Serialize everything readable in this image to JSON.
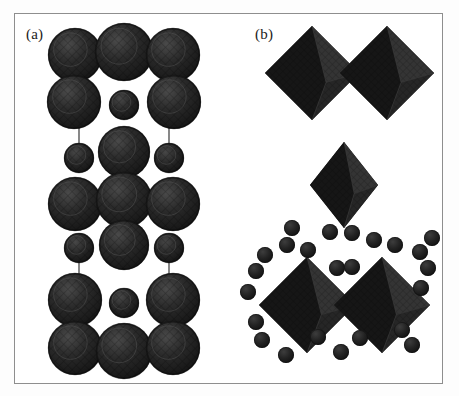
{
  "figure": {
    "type": "crystal-structure-illustration",
    "background_color": "#ffffff",
    "frame": {
      "color": "#8e8e8e",
      "x": 14,
      "y": 13,
      "width": 429,
      "height": 371
    },
    "panels": [
      {
        "id": "a",
        "label": "(a)",
        "label_x": 26,
        "label_y": 26,
        "representation": "space-filling-sphere-packing",
        "description": "Vertical stack of alternating layers of large and small spheres forming a unit cell column",
        "sphere_color": "#242424",
        "sphere_highlight_color": "#3a3a3a",
        "sphere_shadow_color": "#141414",
        "bond_color": "#555555",
        "column_center_x": 124,
        "large_radius": 27,
        "medium_radius": 24,
        "small_radius": 14
      },
      {
        "id": "b",
        "label": "(b)",
        "label_x": 255,
        "label_y": 26,
        "representation": "polyhedral-octahedra-and-spheres",
        "description": "Corner-sharing octahedra pairs with surrounding small spheres",
        "octahedron_front_color": "#1f1f1f",
        "octahedron_light_face_color": "#343434",
        "octahedron_dark_face_color": "#161616",
        "sphere_color": "#242424",
        "groups": [
          "top-octahedra-pair",
          "middle-single-octahedron",
          "bottom-octahedra-pair",
          "scattered-spheres"
        ]
      }
    ]
  },
  "chart_data": {
    "type": "scatter",
    "title": "",
    "xlabel": "",
    "ylabel": "",
    "grid": false,
    "legend": null,
    "panel_a_spheres": [
      {
        "cx": 75,
        "cy": 55,
        "r": 27,
        "kind": "large"
      },
      {
        "cx": 124,
        "cy": 52,
        "r": 29,
        "kind": "large"
      },
      {
        "cx": 173,
        "cy": 55,
        "r": 27,
        "kind": "large"
      },
      {
        "cx": 74,
        "cy": 102,
        "r": 27,
        "kind": "large"
      },
      {
        "cx": 124,
        "cy": 105,
        "r": 15,
        "kind": "small"
      },
      {
        "cx": 174,
        "cy": 102,
        "r": 27,
        "kind": "large"
      },
      {
        "cx": 79,
        "cy": 158,
        "r": 15,
        "kind": "small"
      },
      {
        "cx": 124,
        "cy": 152,
        "r": 26,
        "kind": "large"
      },
      {
        "cx": 169,
        "cy": 158,
        "r": 15,
        "kind": "small"
      },
      {
        "cx": 75,
        "cy": 204,
        "r": 27,
        "kind": "large"
      },
      {
        "cx": 124,
        "cy": 200,
        "r": 28,
        "kind": "large"
      },
      {
        "cx": 173,
        "cy": 204,
        "r": 27,
        "kind": "large"
      },
      {
        "cx": 79,
        "cy": 248,
        "r": 15,
        "kind": "small"
      },
      {
        "cx": 124,
        "cy": 245,
        "r": 25,
        "kind": "large"
      },
      {
        "cx": 169,
        "cy": 248,
        "r": 15,
        "kind": "small"
      },
      {
        "cx": 75,
        "cy": 300,
        "r": 27,
        "kind": "large"
      },
      {
        "cx": 124,
        "cy": 303,
        "r": 15,
        "kind": "small"
      },
      {
        "cx": 173,
        "cy": 300,
        "r": 27,
        "kind": "large"
      },
      {
        "cx": 75,
        "cy": 348,
        "r": 27,
        "kind": "large"
      },
      {
        "cx": 124,
        "cy": 351,
        "r": 28,
        "kind": "large"
      },
      {
        "cx": 173,
        "cy": 348,
        "r": 27,
        "kind": "large"
      }
    ],
    "panel_a_bonds": [
      {
        "x1": 79,
        "y1": 128,
        "x2": 79,
        "y2": 145
      },
      {
        "x1": 169,
        "y1": 128,
        "x2": 169,
        "y2": 145
      },
      {
        "x1": 79,
        "y1": 262,
        "x2": 79,
        "y2": 278
      },
      {
        "x1": 169,
        "y1": 262,
        "x2": 169,
        "y2": 278
      }
    ],
    "panel_b_octahedra": [
      {
        "cx": 312,
        "cy": 73,
        "rx": 47,
        "ry": 47,
        "group": "top-pair-left"
      },
      {
        "cx": 387,
        "cy": 73,
        "rx": 47,
        "ry": 47,
        "group": "top-pair-right"
      },
      {
        "cx": 344,
        "cy": 185,
        "rx": 34,
        "ry": 43,
        "group": "middle-single"
      },
      {
        "cx": 307,
        "cy": 305,
        "rx": 48,
        "ry": 48,
        "group": "bottom-pair-left"
      },
      {
        "cx": 382,
        "cy": 305,
        "rx": 48,
        "ry": 48,
        "group": "bottom-pair-right"
      }
    ],
    "panel_b_spheres": [
      {
        "cx": 308,
        "cy": 250,
        "r": 8
      },
      {
        "cx": 287,
        "cy": 245,
        "r": 8
      },
      {
        "cx": 374,
        "cy": 240,
        "r": 8
      },
      {
        "cx": 395,
        "cy": 245,
        "r": 8
      },
      {
        "cx": 330,
        "cy": 232,
        "r": 8
      },
      {
        "cx": 352,
        "cy": 233,
        "r": 8
      },
      {
        "cx": 265,
        "cy": 255,
        "r": 8
      },
      {
        "cx": 420,
        "cy": 252,
        "r": 8
      },
      {
        "cx": 256,
        "cy": 271,
        "r": 8
      },
      {
        "cx": 428,
        "cy": 268,
        "r": 8
      },
      {
        "cx": 337,
        "cy": 268,
        "r": 8
      },
      {
        "cx": 352,
        "cy": 267,
        "r": 8
      },
      {
        "cx": 248,
        "cy": 292,
        "r": 8
      },
      {
        "cx": 421,
        "cy": 288,
        "r": 8
      },
      {
        "cx": 256,
        "cy": 322,
        "r": 8
      },
      {
        "cx": 262,
        "cy": 340,
        "r": 8
      },
      {
        "cx": 402,
        "cy": 330,
        "r": 8
      },
      {
        "cx": 412,
        "cy": 345,
        "r": 8
      },
      {
        "cx": 286,
        "cy": 355,
        "r": 8
      },
      {
        "cx": 341,
        "cy": 352,
        "r": 8
      },
      {
        "cx": 318,
        "cy": 337,
        "r": 8
      },
      {
        "cx": 360,
        "cy": 338,
        "r": 8
      },
      {
        "cx": 432,
        "cy": 238,
        "r": 8
      },
      {
        "cx": 292,
        "cy": 228,
        "r": 8
      }
    ]
  }
}
